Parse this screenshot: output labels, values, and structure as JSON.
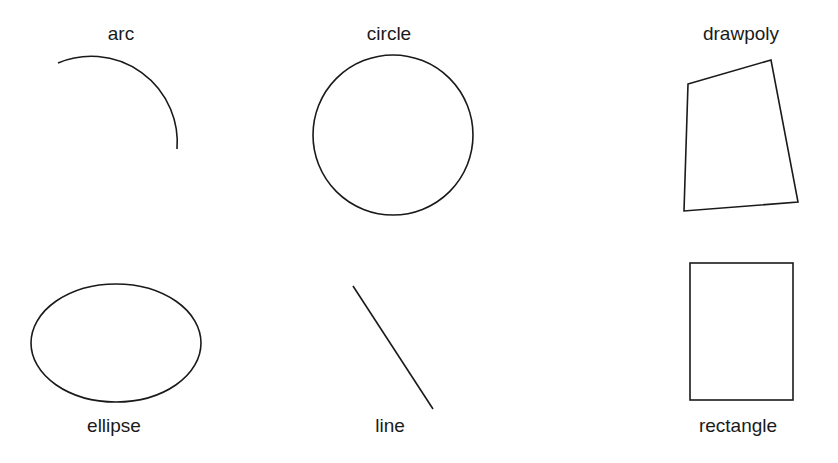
{
  "labels": {
    "arc": "arc",
    "circle": "circle",
    "drawpoly": "drawpoly",
    "ellipse": "ellipse",
    "line": "line",
    "rectangle": "rectangle"
  },
  "colors": {
    "stroke": "#1a1a1a",
    "background": "#ffffff"
  }
}
